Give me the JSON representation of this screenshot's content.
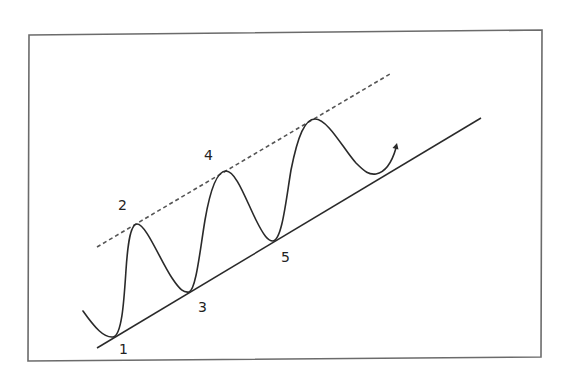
{
  "diagram": {
    "title": "",
    "type": "ascending channel / wave pattern",
    "colors": {
      "frame": "#6b6b6b",
      "line": "#2a2a2a",
      "dashed": "#555555",
      "text": "#222222",
      "background": "#ffffff"
    },
    "point_labels": [
      "1",
      "2",
      "3",
      "4",
      "5"
    ],
    "elements": {
      "support_line": "solid trend line connecting troughs 1, 3, 5",
      "resistance_line": "dashed line touching peaks 2, 4 and the next peak",
      "price_curve": "oscillating curve ending with an upward arrow"
    }
  }
}
